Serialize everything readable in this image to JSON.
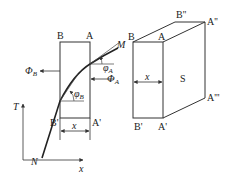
{
  "left_figure": {
    "top_left_label": "B",
    "top_right_label": "A",
    "bottom_left_label": "B'",
    "bottom_right_label": "A'",
    "curve_top_label": "M",
    "curve_bottom_label": "N",
    "flux_left_label": "Φ",
    "flux_left_sub": "B",
    "flux_right_label": "Φ",
    "flux_right_sub": "A",
    "angle_top_label": "φ",
    "angle_top_sub": "A",
    "angle_bottom_label": "φ",
    "angle_bottom_sub": "B",
    "width_label": "x",
    "y_axis_label": "T",
    "x_axis_label": "x"
  },
  "right_figure": {
    "front_top_left": "B",
    "front_top_right": "A",
    "front_bottom_left": "B'",
    "front_bottom_right": "A'",
    "back_top_left": "B''",
    "back_top_right": "A''",
    "back_bottom_right": "A'''",
    "width_label": "x",
    "face_label": "S"
  },
  "colors": {
    "stroke": "#333333",
    "text": "#222222"
  }
}
